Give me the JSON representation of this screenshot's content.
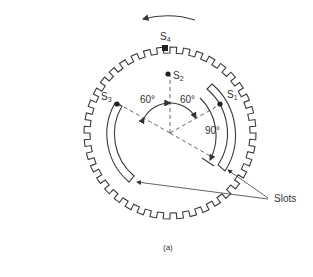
{
  "figure": {
    "caption": "(a)",
    "rotation_direction": "counterclockwise",
    "tooth_count": 40,
    "sensors": [
      {
        "id": "S1",
        "label": "S",
        "sub": "1"
      },
      {
        "id": "S2",
        "label": "S",
        "sub": "2"
      },
      {
        "id": "S3",
        "label": "S",
        "sub": "3"
      },
      {
        "id": "S4",
        "label": "S",
        "sub": "4"
      }
    ],
    "angles": {
      "left": "60°",
      "right": "60°",
      "slot_span": "90°"
    },
    "callout": "Slots"
  }
}
